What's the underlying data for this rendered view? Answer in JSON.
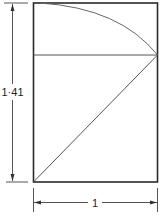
{
  "diagram": {
    "height_label": "1·41",
    "width_label": "1",
    "colors": {
      "stroke": "#2a2a2a",
      "thin": "#555555",
      "background": "#ffffff"
    },
    "elements": [
      "outer-rectangle",
      "quarter-arc",
      "horizontal-line",
      "diagonal",
      "height-dimension",
      "width-dimension"
    ]
  }
}
